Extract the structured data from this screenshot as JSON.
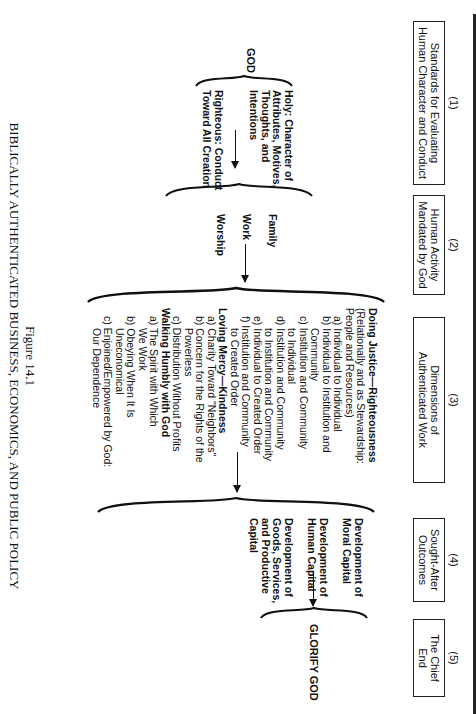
{
  "figure": {
    "number": "Figure 14.1",
    "title": "BIBLICALLY AUTHENTICATED BUSINESS, ECONOMICS, AND PUBLIC POLICY"
  },
  "headers": [
    {
      "num": "(1)",
      "line1": "Standards for Evaluating",
      "line2": "Human Character and Conduct"
    },
    {
      "num": "(2)",
      "line1": "Human Activity",
      "line2": "Mandated by God"
    },
    {
      "num": "(3)",
      "line1": "Dimensions of",
      "line2": "Authenticated Work"
    },
    {
      "num": "(4)",
      "line1": "Sought-After",
      "line2": "Outcomes"
    },
    {
      "num": "(5)",
      "line1": "The Chief",
      "line2": "End"
    }
  ],
  "col1": {
    "source": "GOD",
    "holy": [
      "Holy: Character of",
      "Attributes, Motives,",
      "Thoughts, and",
      "Intentions"
    ],
    "righteous": [
      "Righteous: Conduct",
      "Toward All Creation"
    ]
  },
  "col2": {
    "items": [
      "Family",
      "Work",
      "Worship"
    ]
  },
  "col3": {
    "justice": {
      "title": "Doing Justice—Righteousness",
      "sub1": "(Relationally and as Stewardship:",
      "sub2": "People and Resources)",
      "items": [
        {
          "label": "a)",
          "lines": [
            "Individual to Individual"
          ]
        },
        {
          "label": "b)",
          "lines": [
            "Individual to Institution and",
            "Community"
          ]
        },
        {
          "label": "c)",
          "lines": [
            "Institution and Community",
            "to Individual"
          ]
        },
        {
          "label": "d)",
          "lines": [
            "Institution and Community",
            "to Institution and Community"
          ]
        },
        {
          "label": "e)",
          "lines": [
            "Individual to Created Order"
          ]
        },
        {
          "label": "f)",
          "lines": [
            "Institution and Community",
            "to Created Order"
          ]
        }
      ]
    },
    "mercy": {
      "title": "Loving Mercy—Kindness",
      "items": [
        {
          "label": "a)",
          "lines": [
            "Charity Toward \"Neighbors\""
          ]
        },
        {
          "label": "b)",
          "lines": [
            "Concern for the Rights of the",
            "Powerless"
          ]
        },
        {
          "label": "c)",
          "lines": [
            "Distribution Without Profits"
          ]
        }
      ]
    },
    "humbly": {
      "title": "Walking Humbly with God",
      "items": [
        {
          "label": "a)",
          "lines": [
            "The Spirit with Which",
            "We Work"
          ]
        },
        {
          "label": "b)",
          "lines": [
            "Obeying When It Is",
            "Uneconomical"
          ]
        },
        {
          "label": "c)",
          "lines": [
            "Enjoined/Empowered by God:",
            "Our Dependence"
          ]
        }
      ]
    }
  },
  "col4": {
    "items": [
      [
        "Development of",
        "Moral Capital"
      ],
      [
        "Development of",
        "Human Capital"
      ],
      [
        "Development of",
        "Goods, Services,",
        "and Productive",
        "Capital"
      ]
    ]
  },
  "col5": {
    "end": "GLORIFY GOD"
  }
}
